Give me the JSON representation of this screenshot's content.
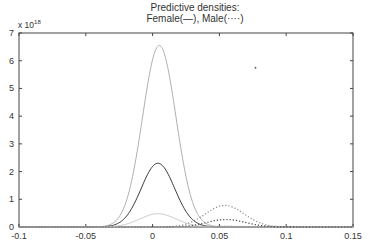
{
  "chart_data": {
    "type": "line",
    "title": "Predictive densities:",
    "subtitle": "Female(—),  Male(····)",
    "xlabel": "",
    "ylabel": "",
    "y_exponent_label": "x 10",
    "y_exponent": "18",
    "xlim": [
      -0.1,
      0.15
    ],
    "ylim": [
      0,
      7
    ],
    "x_ticks": [
      "-0.1",
      "-0.05",
      "0",
      "0.05",
      "0.1",
      "0.15"
    ],
    "y_ticks": [
      "0",
      "1",
      "2",
      "3",
      "4",
      "5",
      "6",
      "7"
    ],
    "grid": false,
    "legend": "in title",
    "series": [
      {
        "name": "Female upper band",
        "style": "solid",
        "color": "#b0b0b0",
        "mean": 0.005,
        "sd": 0.0125,
        "peak": 6.55
      },
      {
        "name": "Female predictive density",
        "style": "solid",
        "color": "#333333",
        "mean": 0.004,
        "sd": 0.0125,
        "peak": 2.3
      },
      {
        "name": "Female lower band",
        "style": "solid",
        "color": "#c8c8c8",
        "mean": 0.004,
        "sd": 0.0135,
        "peak": 0.48
      },
      {
        "name": "Male upper band",
        "style": "dotted",
        "color": "#888888",
        "mean": 0.054,
        "sd": 0.0145,
        "peak": 0.78
      },
      {
        "name": "Male predictive density",
        "style": "dotted",
        "color": "#444444",
        "mean": 0.055,
        "sd": 0.0145,
        "peak": 0.27
      },
      {
        "name": "Male lower band",
        "style": "dotted",
        "color": "#aaaaaa",
        "mean": 0.055,
        "sd": 0.015,
        "peak": 0.03
      }
    ],
    "annotations": [
      {
        "type": "point",
        "x": 0.077,
        "y": 5.75
      }
    ]
  }
}
